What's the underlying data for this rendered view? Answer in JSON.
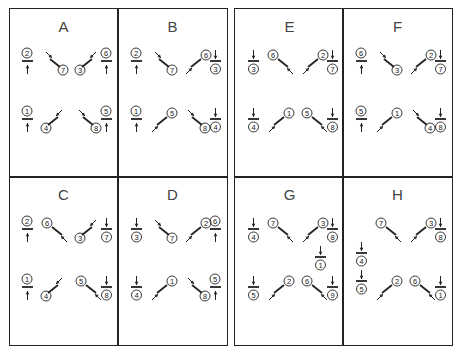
{
  "figure": {
    "colors": {
      "line": "#222222",
      "label": "#444444",
      "background": "#ffffff"
    },
    "panels": [
      {
        "label": "A",
        "items": [
          {
            "type": "h-up",
            "num": "2",
            "x": 13,
            "y": 42
          },
          {
            "type": "bs-down",
            "num": "7",
            "x": 37,
            "y": 42
          },
          {
            "type": "fs-down",
            "num": "3",
            "x": 68,
            "y": 42
          },
          {
            "type": "h-up",
            "num": "6",
            "x": 92,
            "y": 42
          },
          {
            "type": "h-up",
            "num": "1",
            "x": 13,
            "y": 100
          },
          {
            "type": "fs-down",
            "num": "4",
            "x": 34,
            "y": 100
          },
          {
            "type": "bs-down",
            "num": "8",
            "x": 70,
            "y": 100
          },
          {
            "type": "h-up",
            "num": "5",
            "x": 92,
            "y": 100
          }
        ]
      },
      {
        "label": "B",
        "items": [
          {
            "type": "h-up",
            "num": "2",
            "x": 13,
            "y": 42
          },
          {
            "type": "bs-down",
            "num": "7",
            "x": 37,
            "y": 42
          },
          {
            "type": "fs-up",
            "num": "6",
            "x": 68,
            "y": 42
          },
          {
            "type": "h-down",
            "num": "3",
            "x": 92,
            "y": 42
          },
          {
            "type": "h-up",
            "num": "1",
            "x": 13,
            "y": 100
          },
          {
            "type": "fs-up",
            "num": "5",
            "x": 34,
            "y": 100
          },
          {
            "type": "bs-down",
            "num": "8",
            "x": 70,
            "y": 100
          },
          {
            "type": "h-down",
            "num": "4",
            "x": 92,
            "y": 100
          }
        ]
      },
      {
        "label": "C",
        "items": [
          {
            "type": "h-up",
            "num": "2",
            "x": 13,
            "y": 42
          },
          {
            "type": "bs-up",
            "num": "6",
            "x": 34,
            "y": 42
          },
          {
            "type": "fs-down",
            "num": "3",
            "x": 68,
            "y": 42
          },
          {
            "type": "h-down",
            "num": "7",
            "x": 92,
            "y": 42
          },
          {
            "type": "h-up",
            "num": "1",
            "x": 13,
            "y": 100
          },
          {
            "type": "fs-down",
            "num": "4",
            "x": 34,
            "y": 100
          },
          {
            "type": "bs-up",
            "num": "5",
            "x": 68,
            "y": 100
          },
          {
            "type": "h-down",
            "num": "8",
            "x": 92,
            "y": 100
          }
        ]
      },
      {
        "label": "D",
        "items": [
          {
            "type": "h-down",
            "num": "3",
            "x": 13,
            "y": 42
          },
          {
            "type": "bs-down",
            "num": "7",
            "x": 37,
            "y": 42
          },
          {
            "type": "fs-up",
            "num": "2",
            "x": 68,
            "y": 42
          },
          {
            "type": "h-up",
            "num": "6",
            "x": 92,
            "y": 42
          },
          {
            "type": "h-down",
            "num": "4",
            "x": 13,
            "y": 100
          },
          {
            "type": "fs-up",
            "num": "1",
            "x": 34,
            "y": 100
          },
          {
            "type": "bs-down",
            "num": "8",
            "x": 70,
            "y": 100
          },
          {
            "type": "h-up",
            "num": "5",
            "x": 92,
            "y": 100
          }
        ]
      },
      {
        "label": "E",
        "items": [
          {
            "type": "h-down",
            "num": "3",
            "x": 13,
            "y": 42
          },
          {
            "type": "bs-up",
            "num": "6",
            "x": 34,
            "y": 42
          },
          {
            "type": "fs-up",
            "num": "2",
            "x": 68,
            "y": 42
          },
          {
            "type": "h-down",
            "num": "7",
            "x": 92,
            "y": 42
          },
          {
            "type": "h-down",
            "num": "4",
            "x": 13,
            "y": 100
          },
          {
            "type": "fs-up",
            "num": "1",
            "x": 34,
            "y": 100
          },
          {
            "type": "bs-up",
            "num": "5",
            "x": 68,
            "y": 100
          },
          {
            "type": "h-down",
            "num": "8",
            "x": 92,
            "y": 100
          }
        ]
      },
      {
        "label": "F",
        "items": [
          {
            "type": "h-up",
            "num": "6",
            "x": 13,
            "y": 42
          },
          {
            "type": "bs-down",
            "num": "3",
            "x": 37,
            "y": 42
          },
          {
            "type": "fs-up",
            "num": "2",
            "x": 68,
            "y": 42
          },
          {
            "type": "h-down",
            "num": "7",
            "x": 92,
            "y": 42
          },
          {
            "type": "h-up",
            "num": "5",
            "x": 13,
            "y": 100
          },
          {
            "type": "fs-up",
            "num": "1",
            "x": 34,
            "y": 100
          },
          {
            "type": "bs-down",
            "num": "4",
            "x": 70,
            "y": 100
          },
          {
            "type": "h-down",
            "num": "8",
            "x": 92,
            "y": 100
          }
        ]
      },
      {
        "label": "G",
        "items": [
          {
            "type": "h-down",
            "num": "4",
            "x": 13,
            "y": 42
          },
          {
            "type": "bs-up",
            "num": "7",
            "x": 34,
            "y": 42
          },
          {
            "type": "fs-up",
            "num": "3",
            "x": 68,
            "y": 42
          },
          {
            "type": "h-down",
            "num": "8",
            "x": 92,
            "y": 42
          },
          {
            "type": "h-down",
            "num": "1",
            "x": 80,
            "y": 70
          },
          {
            "type": "h-down",
            "num": "5",
            "x": 13,
            "y": 100
          },
          {
            "type": "fs-up",
            "num": "2",
            "x": 34,
            "y": 100
          },
          {
            "type": "bs-up",
            "num": "6",
            "x": 68,
            "y": 100
          },
          {
            "type": "h-down",
            "num": "9",
            "x": 92,
            "y": 100
          }
        ]
      },
      {
        "label": "H",
        "items": [
          {
            "type": "bs-up",
            "num": "7",
            "x": 34,
            "y": 42
          },
          {
            "type": "fs-up",
            "num": "3",
            "x": 68,
            "y": 42
          },
          {
            "type": "h-down",
            "num": "8",
            "x": 92,
            "y": 42
          },
          {
            "type": "h-down",
            "num": "4",
            "x": 13,
            "y": 66
          },
          {
            "type": "h-down",
            "num": "5",
            "x": 13,
            "y": 94
          },
          {
            "type": "fs-up",
            "num": "2",
            "x": 34,
            "y": 100
          },
          {
            "type": "bs-up",
            "num": "6",
            "x": 68,
            "y": 100
          },
          {
            "type": "h-down",
            "num": "1",
            "x": 92,
            "y": 100
          }
        ]
      }
    ]
  }
}
